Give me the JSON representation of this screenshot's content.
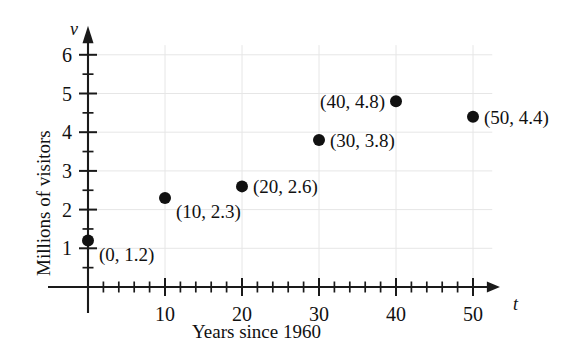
{
  "chart_data": {
    "type": "scatter",
    "title": "",
    "xlabel": "Years since 1960",
    "ylabel": "Millions of visitors",
    "x_axis_variable": "t",
    "y_axis_variable": "v",
    "xlim": [
      0,
      52
    ],
    "ylim": [
      0,
      6.4
    ],
    "grid": true,
    "legend": "none",
    "x_ticks": [
      10,
      20,
      30,
      40,
      50
    ],
    "x_tick_labels": [
      "10",
      "20",
      "30",
      "40",
      "50"
    ],
    "x_minor_tick_step": 2,
    "y_ticks": [
      1,
      2,
      3,
      4,
      5,
      6
    ],
    "y_tick_labels": [
      "1",
      "2",
      "3",
      "4",
      "5",
      "6"
    ],
    "y_minor_tick_step": 0.5,
    "x": [
      0,
      10,
      20,
      30,
      40,
      50
    ],
    "values": [
      1.2,
      2.3,
      2.6,
      3.8,
      4.8,
      4.4
    ],
    "points": [
      {
        "x": 0,
        "y": 1.2,
        "label": "(0, 1.2)",
        "label_side": "right"
      },
      {
        "x": 10,
        "y": 2.3,
        "label": "(10, 2.3)",
        "label_side": "right"
      },
      {
        "x": 20,
        "y": 2.6,
        "label": "(20, 2.6)",
        "label_side": "right"
      },
      {
        "x": 30,
        "y": 3.8,
        "label": "(30, 3.8)",
        "label_side": "right"
      },
      {
        "x": 40,
        "y": 4.8,
        "label": "(40, 4.8)",
        "label_side": "left"
      },
      {
        "x": 50,
        "y": 4.4,
        "label": "(50, 4.4)",
        "label_side": "right"
      }
    ],
    "marker": {
      "shape": "circle",
      "color": "#111111",
      "radius": 6
    },
    "colors": {
      "axis": "#1a1a1a",
      "grid": "#e6e6e6",
      "text": "#111111",
      "background": "#ffffff"
    }
  }
}
